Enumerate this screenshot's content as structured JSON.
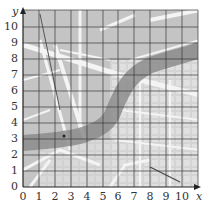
{
  "figure": {
    "type": "map-with-coordinate-grid",
    "x_axis": {
      "label": "x",
      "ticks": [
        "0",
        "1",
        "2",
        "3",
        "4",
        "5",
        "6",
        "7",
        "8",
        "9",
        "10"
      ]
    },
    "y_axis": {
      "label": "y",
      "ticks": [
        "0",
        "1",
        "2",
        "3",
        "4",
        "5",
        "6",
        "7",
        "8",
        "9",
        "10"
      ]
    },
    "grid": {
      "xmin": 0,
      "xmax": 11,
      "ymin": 0,
      "ymax": 11,
      "step": 1
    },
    "features": {
      "river": {
        "description": "grey river band curving from left (y≈2.5) through (5,3) up to top right (y≈9)"
      },
      "marked_point": {
        "x": 2.5,
        "y": 3.2
      }
    },
    "colors": {
      "map_base": "#c9c9c9",
      "river": "#8f8f8f",
      "roads": "#f2f2f2",
      "blocks": "#dcdcdc",
      "grid": "#333333"
    }
  }
}
